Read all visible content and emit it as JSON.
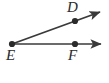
{
  "figure": {
    "kind": "geometry-diagram",
    "background_color": "#ffffff",
    "stroke_color": "#3a3a3a",
    "point_color": "#2b2b2b",
    "label_color": "#2b2b2b",
    "width": 109,
    "height": 83
  },
  "labels": {
    "D": "D",
    "E": "E",
    "F": "F"
  },
  "points": [
    {
      "name": "E",
      "label": "E",
      "x": 12,
      "y": 44,
      "role": "vertex"
    },
    {
      "name": "D",
      "label": "D",
      "x": 75,
      "y": 21,
      "role": "ray-point"
    },
    {
      "name": "F",
      "label": "F",
      "x": 75,
      "y": 44,
      "role": "ray-point"
    }
  ],
  "rays": [
    {
      "name": "ray-ED",
      "from": "E",
      "through": "D",
      "start_x": 12,
      "start_y": 44,
      "end_x": 103,
      "end_y": 11,
      "arrow": "end"
    },
    {
      "name": "ray-EF",
      "from": "E",
      "through": "F",
      "start_x": 12,
      "start_y": 44,
      "end_x": 104,
      "end_y": 44,
      "arrow": "end"
    }
  ],
  "angle": {
    "name": "angle-DEF",
    "vertex": "E",
    "sides": [
      "D",
      "F"
    ]
  }
}
